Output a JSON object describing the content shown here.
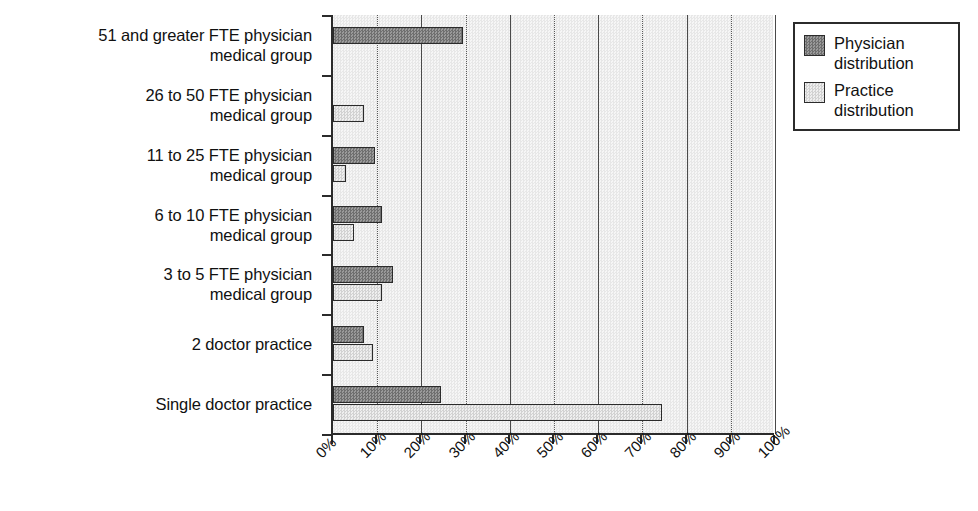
{
  "chart_data": {
    "type": "bar",
    "orientation": "horizontal",
    "title": "",
    "xlabel": "",
    "ylabel": "",
    "xlim": [
      0,
      100
    ],
    "xticks": [
      "0%",
      "10%",
      "20%",
      "30%",
      "40%",
      "50%",
      "60%",
      "70%",
      "80%",
      "90%",
      "100%"
    ],
    "grid": true,
    "legend_position": "right",
    "categories": [
      "51 and greater FTE physician medical group",
      "26 to 50 FTE physician medical group",
      "11 to 25 FTE physician medical group",
      "6 to 10 FTE physician medical group",
      "3 to 5 FTE physician medical group",
      "2 doctor practice",
      "Single doctor practice"
    ],
    "category_lines": [
      [
        "51 and greater FTE physician",
        "medical group"
      ],
      [
        "26 to 50 FTE physician",
        "medical group"
      ],
      [
        "11 to 25 FTE physician",
        "medical group"
      ],
      [
        "6 to 10 FTE physician",
        "medical group"
      ],
      [
        "3 to 5 FTE physician",
        "medical group"
      ],
      [
        "2 doctor practice"
      ],
      [
        "Single doctor practice"
      ]
    ],
    "series": [
      {
        "name": "Physician distribution",
        "color": "#8a8a8a",
        "values": [
          29.5,
          0,
          9.5,
          11.0,
          13.5,
          7.0,
          24.5
        ]
      },
      {
        "name": "Practice distribution",
        "color": "#e0e0e0",
        "values": [
          0,
          7.0,
          3.0,
          4.7,
          11.0,
          9.0,
          74.5
        ]
      }
    ]
  },
  "legend": {
    "items": [
      {
        "label_line1": "Physician",
        "label_line2": "distribution",
        "swatch": "dark-gray-hatch"
      },
      {
        "label_line1": "Practice",
        "label_line2": "distribution",
        "swatch": "light-gray-hatch"
      }
    ]
  }
}
